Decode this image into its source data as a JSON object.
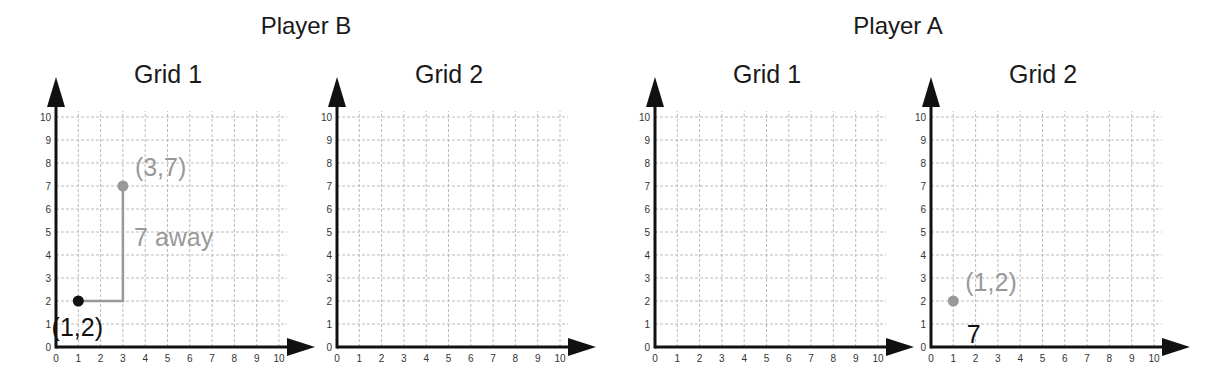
{
  "players": [
    {
      "title": "Player B",
      "grids": [
        {
          "title": "Grid 1",
          "points": [
            {
              "x": 1,
              "y": 2,
              "label": "(1,2)",
              "color": "#111111",
              "label_pos": "below-left"
            },
            {
              "x": 3,
              "y": 7,
              "label": "(3,7)",
              "color": "#999999",
              "label_pos": "above-right"
            }
          ],
          "paths": [
            {
              "points": [
                [
                  1,
                  2
                ],
                [
                  3,
                  2
                ],
                [
                  3,
                  7
                ]
              ],
              "color": "#999999"
            }
          ],
          "annotations": [
            {
              "text": "7 away",
              "x": 3.5,
              "y": 4.8,
              "color": "#999999"
            }
          ]
        },
        {
          "title": "Grid 2",
          "points": [],
          "paths": [],
          "annotations": []
        }
      ]
    },
    {
      "title": "Player A",
      "grids": [
        {
          "title": "Grid 1",
          "points": [],
          "paths": [],
          "annotations": []
        },
        {
          "title": "Grid 2",
          "points": [
            {
              "x": 1,
              "y": 2,
              "label": "(1,2)",
              "color": "#999999",
              "label_pos": "above-right"
            }
          ],
          "paths": [],
          "annotations": [
            {
              "text": "7",
              "x": 1.6,
              "y": 0.55,
              "color": "#111111"
            }
          ]
        }
      ]
    }
  ],
  "axes": {
    "x_ticks": [
      "0",
      "1",
      "2",
      "3",
      "4",
      "5",
      "6",
      "7",
      "8",
      "9",
      "10"
    ],
    "y_ticks": [
      "0",
      "1",
      "2",
      "3",
      "4",
      "5",
      "6",
      "7",
      "8",
      "9",
      "10"
    ],
    "range": [
      0,
      10
    ]
  },
  "colors": {
    "axis": "#111111",
    "grid": "#bbbbbb",
    "dark_point": "#111111",
    "light_point": "#999999"
  }
}
